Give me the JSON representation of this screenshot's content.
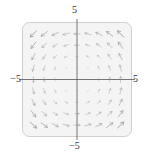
{
  "figure": {
    "title": "",
    "axis_labels": {
      "top": "5",
      "bottom": "−5",
      "left": "−5",
      "right": "5"
    }
  },
  "chart_data": {
    "type": "scatter",
    "plot_kind": "vector-field",
    "title": "",
    "xlabel": "",
    "ylabel": "",
    "xlim": [
      -5,
      5
    ],
    "ylim": [
      -5,
      5
    ],
    "grid": false,
    "axes_drawn": [
      "x-axis at y=0",
      "y-axis at x=0"
    ],
    "tick_labels": {
      "x": [
        "−5",
        "5"
      ],
      "y": [
        "−5",
        "5"
      ]
    },
    "field": {
      "description": "Counterclockwise rotational vector field; arrow length grows with distance from the origin and fades near the center.",
      "u_formula": "-y",
      "v_formula": "x",
      "grid_nx": 11,
      "grid_ny": 11,
      "sample_x": [
        -5,
        -4,
        -3,
        -2,
        -1,
        0,
        1,
        2,
        3,
        4,
        5
      ],
      "sample_y": [
        -5,
        -4,
        -3,
        -2,
        -1,
        0,
        1,
        2,
        3,
        4,
        5
      ],
      "arrow_color": "#8a8a8a",
      "max_arrow_px": 11
    },
    "style": {
      "panel_background": "#f4f4f4",
      "panel_border": "#d0d0d0",
      "axis_color": "#555555",
      "text_color": "#333333",
      "corner_radius_px": 7
    }
  }
}
